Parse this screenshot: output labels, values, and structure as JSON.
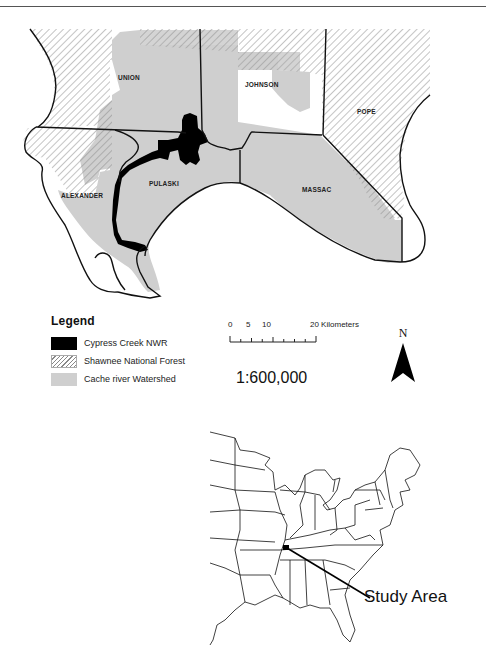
{
  "figure": {
    "type": "study area location map",
    "main_map": {
      "counties": [
        {
          "id": "union",
          "label": "UNION"
        },
        {
          "id": "johnson",
          "label": "JOHNSON"
        },
        {
          "id": "pope",
          "label": "POPE"
        },
        {
          "id": "alexander",
          "label": "ALEXANDER"
        },
        {
          "id": "pulaski",
          "label": "PULASKI"
        },
        {
          "id": "massac",
          "label": "MASSAC"
        }
      ]
    },
    "legend": {
      "title": "Legend",
      "items": [
        {
          "label": "Cypress Creek NWR",
          "symbol": "solid-black",
          "color": "#000000"
        },
        {
          "label": "Shawnee National Forest",
          "symbol": "diagonal-hatch",
          "color": "#888888"
        },
        {
          "label": "Cache river Watershed",
          "symbol": "solid-gray",
          "color": "#cfcfcf"
        }
      ]
    },
    "scale_bar": {
      "ticks": [
        "0",
        "5",
        "10",
        "20"
      ],
      "units": "Kilometers",
      "label": "20 Kilometers"
    },
    "scale_ratio": "1:600,000",
    "north_arrow": {
      "label": "N"
    },
    "inset_map": {
      "region": "Eastern United States",
      "callout_label": "Study Area"
    }
  },
  "colors": {
    "watershed": "#cfcfcf",
    "forest_hatch": "#888888",
    "refuge": "#000000",
    "boundary": "#111111"
  }
}
